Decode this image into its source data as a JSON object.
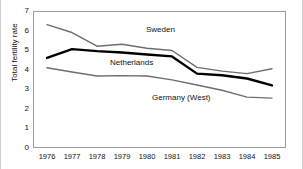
{
  "chart_data": {
    "type": "line",
    "title": "",
    "xlabel": "",
    "ylabel": "Total fertility rate",
    "categories": [
      "1976",
      "1977",
      "1978",
      "1979",
      "1980",
      "1981",
      "1982",
      "1983",
      "1984",
      "1985"
    ],
    "x": [
      1976,
      1977,
      1978,
      1979,
      1980,
      1981,
      1982,
      1983,
      1984,
      1985
    ],
    "xlim": [
      1976,
      1985
    ],
    "ylim": [
      0,
      7
    ],
    "yticks": [
      0,
      1,
      2,
      3,
      4,
      5,
      6,
      7
    ],
    "grid": false,
    "legend_position": "inline-annotations",
    "series": [
      {
        "name": "Sweden",
        "color": "#6e6e6e",
        "width": 1.4,
        "values": [
          6.3,
          5.9,
          5.2,
          5.3,
          5.1,
          4.98,
          4.12,
          3.93,
          3.8,
          4.05
        ]
      },
      {
        "name": "Netherlands",
        "color": "#000000",
        "width": 2.4,
        "values": [
          4.6,
          5.05,
          4.95,
          4.88,
          4.78,
          4.68,
          3.8,
          3.72,
          3.55,
          3.2
        ]
      },
      {
        "name": "Germany (West)",
        "color": "#6e6e6e",
        "width": 1.4,
        "values": [
          4.1,
          3.88,
          3.68,
          3.7,
          3.68,
          3.48,
          3.22,
          2.95,
          2.6,
          2.55
        ]
      }
    ],
    "annotations": [
      {
        "text": "Sweden",
        "series": "Sweden"
      },
      {
        "text": "Netherlands",
        "series": "Netherlands"
      },
      {
        "text": "Germany (West)",
        "series": "Germany (West)"
      }
    ],
    "axis_color": "#9a9a9a",
    "text_color": "#111111",
    "background": "#ffffff"
  }
}
